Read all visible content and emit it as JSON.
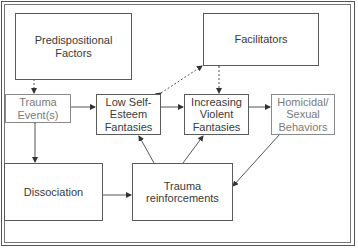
{
  "diagram": {
    "nodes": [
      {
        "id": "predispositional",
        "label": "Predispositional\nFactors"
      },
      {
        "id": "facilitators",
        "label": "Facilitators"
      },
      {
        "id": "trauma_events",
        "label": "Trauma\nEvent(s)"
      },
      {
        "id": "low_self_esteem",
        "label": "Low Self-\nEsteem\nFantasies"
      },
      {
        "id": "increasing_violent",
        "label": "Increasing\nViolent\nFantasies"
      },
      {
        "id": "homicidal_sexual",
        "label": "Homicidal/\nSexual\nBehaviors"
      },
      {
        "id": "dissociation",
        "label": "Dissociation"
      },
      {
        "id": "trauma_reinforcements",
        "label": "Trauma\nreinforcements"
      }
    ],
    "edges": [
      {
        "from": "predispositional",
        "to": "trauma_events",
        "style": "dotted",
        "direction": "forward"
      },
      {
        "from": "low_self_esteem",
        "to": "facilitators",
        "style": "dotted",
        "direction": "both"
      },
      {
        "from": "facilitators",
        "to": "increasing_violent",
        "style": "dotted",
        "direction": "both"
      },
      {
        "from": "trauma_events",
        "to": "low_self_esteem",
        "style": "solid",
        "direction": "forward"
      },
      {
        "from": "low_self_esteem",
        "to": "increasing_violent",
        "style": "solid",
        "direction": "forward"
      },
      {
        "from": "increasing_violent",
        "to": "homicidal_sexual",
        "style": "solid",
        "direction": "forward"
      },
      {
        "from": "trauma_events",
        "to": "dissociation",
        "style": "solid",
        "direction": "both"
      },
      {
        "from": "dissociation",
        "to": "trauma_reinforcements",
        "style": "solid",
        "direction": "forward"
      },
      {
        "from": "trauma_reinforcements",
        "to": "low_self_esteem",
        "style": "solid",
        "direction": "forward"
      },
      {
        "from": "trauma_reinforcements",
        "to": "increasing_violent",
        "style": "solid",
        "direction": "forward"
      },
      {
        "from": "homicidal_sexual",
        "to": "trauma_reinforcements",
        "style": "solid",
        "direction": "forward"
      }
    ]
  }
}
